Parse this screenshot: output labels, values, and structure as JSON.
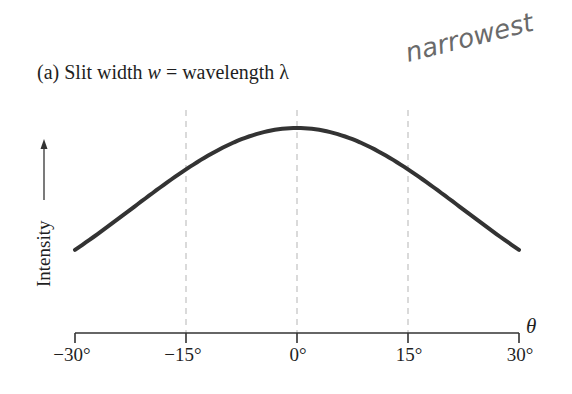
{
  "figure": {
    "title_prefix": "(a) Slit width ",
    "title_w": "w",
    "title_mid": " = wavelength ",
    "title_lambda": "λ",
    "annotation": "narrowest",
    "xlabel": "θ",
    "ylabel": "Intensity"
  },
  "chart_data": {
    "type": "line",
    "title": "(a) Slit width w = wavelength λ",
    "xlabel": "θ",
    "ylabel": "Intensity",
    "xlim": [
      -30,
      30
    ],
    "ylim": [
      0,
      1
    ],
    "x_ticks": [
      -30,
      -15,
      0,
      15,
      30
    ],
    "x_tick_labels": [
      "−30°",
      "−15°",
      "0°",
      "15°",
      "30°"
    ],
    "y_ticks": [],
    "grid": "vertical dashed lines at −15°, 0°, 15°",
    "legend": null,
    "annotations": [
      "narrowest (handwritten)"
    ],
    "series": [
      {
        "name": "Single-slit diffraction intensity (w = λ)",
        "x": [
          -30,
          -25,
          -20,
          -15,
          -10,
          -5,
          0,
          5,
          10,
          15,
          20,
          25,
          30
        ],
        "values": [
          0.41,
          0.53,
          0.67,
          0.8,
          0.91,
          0.98,
          1.0,
          0.98,
          0.91,
          0.8,
          0.67,
          0.53,
          0.41
        ]
      }
    ]
  }
}
